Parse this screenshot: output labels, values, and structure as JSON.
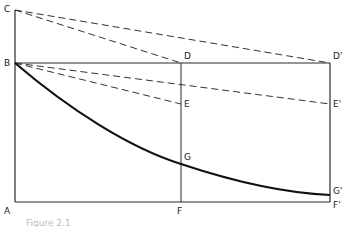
{
  "figure": {
    "caption": "Figure 2.1",
    "colors": {
      "line": "#2b2b2b",
      "curve": "#111111",
      "dashed": "#333333",
      "background": "#ffffff"
    }
  },
  "points": {
    "C": {
      "label": "C",
      "x": 15,
      "y": 10
    },
    "B": {
      "label": "B",
      "x": 15,
      "y": 63
    },
    "A": {
      "label": "A",
      "x": 15,
      "y": 202
    },
    "D": {
      "label": "D",
      "x": 181,
      "y": 63
    },
    "E": {
      "label": "E",
      "x": 181,
      "y": 104
    },
    "G": {
      "label": "G",
      "x": 181,
      "y": 164
    },
    "F": {
      "label": "F",
      "x": 181,
      "y": 202
    },
    "D2": {
      "label": "D'",
      "x": 330,
      "y": 63
    },
    "E2": {
      "label": "E'",
      "x": 330,
      "y": 104
    },
    "G2": {
      "label": "G'",
      "x": 330,
      "y": 195
    },
    "F2": {
      "label": "F'",
      "x": 330,
      "y": 202
    }
  },
  "segments": {
    "solid": [
      [
        "C",
        "A"
      ],
      [
        "B",
        "D2"
      ],
      [
        "A",
        "F2"
      ],
      [
        "D",
        "F"
      ],
      [
        "D2",
        "F2"
      ]
    ],
    "dashed": [
      [
        "C",
        "D"
      ],
      [
        "C",
        "D2"
      ],
      [
        "B",
        "E"
      ],
      [
        "B",
        "E2"
      ]
    ],
    "curve": [
      "B",
      "G",
      "G2"
    ]
  }
}
